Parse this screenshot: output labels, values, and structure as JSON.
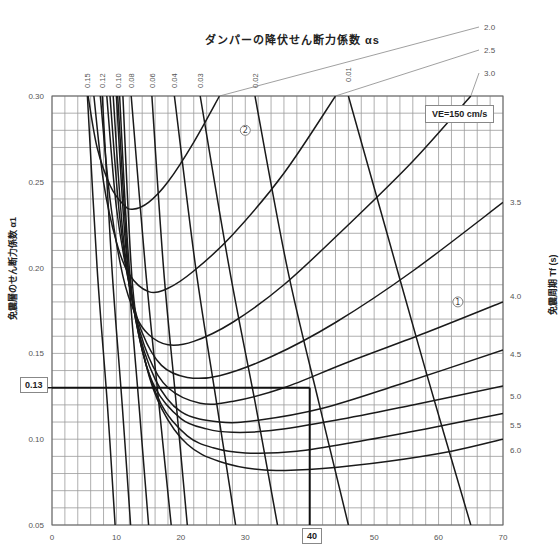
{
  "chart_data": {
    "type": "line",
    "title": "ダンパーの降伏せん断力係数 αs",
    "xlabel": "",
    "ylabel": "免震層のせん断力係数 α1",
    "right_label": "免震周期 Tf (s)",
    "xlim": [
      0,
      70
    ],
    "ylim": [
      0.05,
      0.3
    ],
    "x_ticks": [
      0,
      10,
      20,
      30,
      40,
      50,
      60,
      70
    ],
    "y_ticks": [
      "0.05",
      "0.10",
      "0.15",
      "0.20",
      "0.25",
      "0.30"
    ],
    "grid": {
      "x_step": 2,
      "y_step": 0.01,
      "on": true
    },
    "annotation_box": "VE=150 cm/s",
    "highlight": {
      "x": 40,
      "y": 0.13,
      "x_label": "40",
      "y_label": "0.13"
    },
    "curve_markers": [
      {
        "label": "②",
        "x": 30,
        "y": 0.28
      },
      {
        "label": "①",
        "x": 63,
        "y": 0.18
      }
    ],
    "period_series": [
      {
        "name": "2.0",
        "points": [
          [
            5.6,
            0.3
          ],
          [
            7,
            0.27
          ],
          [
            9,
            0.248
          ],
          [
            11,
            0.237
          ],
          [
            12.5,
            0.234
          ],
          [
            15,
            0.238
          ],
          [
            18,
            0.25
          ],
          [
            22,
            0.273
          ],
          [
            26,
            0.3
          ]
        ]
      },
      {
        "name": "2.5",
        "points": [
          [
            6.5,
            0.3
          ],
          [
            8,
            0.25
          ],
          [
            10,
            0.215
          ],
          [
            12,
            0.196
          ],
          [
            15,
            0.186
          ],
          [
            18,
            0.188
          ],
          [
            22,
            0.198
          ],
          [
            28,
            0.219
          ],
          [
            36,
            0.255
          ],
          [
            44,
            0.3
          ]
        ]
      },
      {
        "name": "3.0",
        "points": [
          [
            7.5,
            0.3
          ],
          [
            9,
            0.24
          ],
          [
            11,
            0.195
          ],
          [
            13,
            0.172
          ],
          [
            15,
            0.161
          ],
          [
            18,
            0.155
          ],
          [
            22,
            0.157
          ],
          [
            28,
            0.168
          ],
          [
            36,
            0.19
          ],
          [
            46,
            0.225
          ],
          [
            56,
            0.262
          ],
          [
            65,
            0.3
          ]
        ]
      },
      {
        "name": "3.5",
        "points": [
          [
            8.5,
            0.3
          ],
          [
            10,
            0.235
          ],
          [
            12,
            0.19
          ],
          [
            14,
            0.162
          ],
          [
            17,
            0.143
          ],
          [
            21,
            0.136
          ],
          [
            26,
            0.137
          ],
          [
            34,
            0.148
          ],
          [
            44,
            0.168
          ],
          [
            56,
            0.198
          ],
          [
            70,
            0.238
          ]
        ]
      },
      {
        "name": "4.0",
        "points": [
          [
            9,
            0.3
          ],
          [
            10.5,
            0.23
          ],
          [
            12.5,
            0.18
          ],
          [
            15,
            0.148
          ],
          [
            18,
            0.13
          ],
          [
            23,
            0.121
          ],
          [
            28,
            0.122
          ],
          [
            36,
            0.13
          ],
          [
            46,
            0.145
          ],
          [
            58,
            0.162
          ],
          [
            70,
            0.18
          ]
        ]
      },
      {
        "name": "4.5",
        "points": [
          [
            9.5,
            0.3
          ],
          [
            11,
            0.22
          ],
          [
            13,
            0.17
          ],
          [
            16,
            0.135
          ],
          [
            20,
            0.116
          ],
          [
            26,
            0.11
          ],
          [
            32,
            0.111
          ],
          [
            42,
            0.118
          ],
          [
            54,
            0.132
          ],
          [
            70,
            0.152
          ]
        ]
      },
      {
        "name": "5.0",
        "points": [
          [
            10,
            0.3
          ],
          [
            11.5,
            0.21
          ],
          [
            13.5,
            0.16
          ],
          [
            16,
            0.13
          ],
          [
            20,
            0.112
          ],
          [
            24,
            0.106
          ],
          [
            28,
            0.104
          ],
          [
            34,
            0.105
          ],
          [
            44,
            0.111
          ],
          [
            56,
            0.12
          ],
          [
            70,
            0.131
          ]
        ]
      },
      {
        "name": "5.5",
        "points": [
          [
            10.5,
            0.3
          ],
          [
            12,
            0.2
          ],
          [
            14,
            0.152
          ],
          [
            17,
            0.12
          ],
          [
            21,
            0.102
          ],
          [
            25,
            0.095
          ],
          [
            30,
            0.092
          ],
          [
            38,
            0.093
          ],
          [
            48,
            0.099
          ],
          [
            58,
            0.106
          ],
          [
            70,
            0.115
          ]
        ]
      },
      {
        "name": "6.0",
        "points": [
          [
            11,
            0.3
          ],
          [
            12.5,
            0.19
          ],
          [
            14.5,
            0.145
          ],
          [
            17,
            0.118
          ],
          [
            21,
            0.097
          ],
          [
            26,
            0.087
          ],
          [
            33,
            0.082
          ],
          [
            42,
            0.083
          ],
          [
            52,
            0.087
          ],
          [
            62,
            0.093
          ],
          [
            70,
            0.1
          ]
        ]
      }
    ],
    "damper_series": [
      {
        "name": "0.15",
        "points": [
          [
            5.5,
            0.3
          ],
          [
            7,
            0.2
          ],
          [
            8.6,
            0.12
          ],
          [
            9.8,
            0.05
          ]
        ]
      },
      {
        "name": "0.12",
        "points": [
          [
            7.8,
            0.3
          ],
          [
            9.3,
            0.2
          ],
          [
            10.9,
            0.12
          ],
          [
            12.2,
            0.05
          ]
        ]
      },
      {
        "name": "0.10",
        "points": [
          [
            10.2,
            0.3
          ],
          [
            11.8,
            0.2
          ],
          [
            13.5,
            0.12
          ],
          [
            15,
            0.05
          ]
        ]
      },
      {
        "name": "0.08",
        "points": [
          [
            12.3,
            0.3
          ],
          [
            14.5,
            0.2
          ],
          [
            16.6,
            0.12
          ],
          [
            18.5,
            0.05
          ]
        ]
      },
      {
        "name": "0.06",
        "points": [
          [
            15.5,
            0.3
          ],
          [
            17.3,
            0.2
          ],
          [
            19.3,
            0.12
          ],
          [
            21,
            0.05
          ]
        ]
      },
      {
        "name": "0.04",
        "points": [
          [
            19,
            0.3
          ],
          [
            22.3,
            0.2
          ],
          [
            25.6,
            0.12
          ],
          [
            28.5,
            0.05
          ]
        ]
      },
      {
        "name": "0.03",
        "points": [
          [
            23,
            0.3
          ],
          [
            27.5,
            0.2
          ],
          [
            31.6,
            0.12
          ],
          [
            35,
            0.05
          ]
        ]
      },
      {
        "name": "0.02",
        "points": [
          [
            31.5,
            0.3
          ],
          [
            36.5,
            0.2
          ],
          [
            41.5,
            0.12
          ],
          [
            46,
            0.05
          ]
        ]
      },
      {
        "name": "0.01",
        "points": [
          [
            46,
            0.3
          ],
          [
            52,
            0.22
          ],
          [
            58,
            0.14
          ],
          [
            65,
            0.05
          ]
        ]
      }
    ],
    "top_labels": [
      "0.15",
      "0.12",
      "0.10",
      "0.08",
      "0.06",
      "0.04",
      "0.03",
      "0.02",
      "0.01"
    ],
    "right_period_labels": [
      {
        "label": "2.0",
        "y_px": 27
      },
      {
        "label": "2.5",
        "y_px": 50
      },
      {
        "label": "3.0",
        "y_px": 73
      },
      {
        "label": "3.5",
        "y_px": 202
      },
      {
        "label": "4.0",
        "y_px": 296
      },
      {
        "label": "4.5",
        "y_px": 354
      },
      {
        "label": "5.0",
        "y_px": 396
      },
      {
        "label": "5.5",
        "y_px": 425
      },
      {
        "label": "6.0",
        "y_px": 450
      }
    ]
  },
  "labels": {
    "title": "ダンパーの降伏せん断力係数 αs",
    "ylabel": "免震層のせん断力係数 α1",
    "right_label": "免震周期 Tf (s)",
    "ve": "VE=150 cm/s",
    "hl_y": "0.13",
    "hl_x": "40"
  }
}
